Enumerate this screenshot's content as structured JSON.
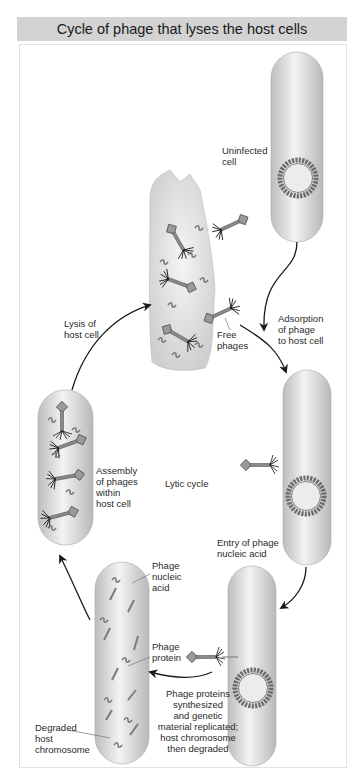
{
  "title": "Cycle of phage that lyses the host cells",
  "center_label": "Lytic cycle",
  "colors": {
    "title_bg": "#d3d3d3",
    "cell_fill": "#c8c8c8",
    "cell_highlight": "#f2f2f2",
    "chromosome_ring": "#6b6b6b",
    "arrow": "#1a1a1a",
    "text": "#2a2a2a"
  },
  "stages": [
    {
      "id": "uninfected",
      "label": "Uninfected\ncell"
    },
    {
      "id": "adsorption",
      "label": "Adsorption\nof phage\nto host cell"
    },
    {
      "id": "entry",
      "label": "Entry of phage\nnucleic acid"
    },
    {
      "id": "synthesis",
      "label": "Phage proteins\nsynthesized\nand genetic\nmaterial replicated;\nhost chromosome\nthen degraded"
    },
    {
      "id": "assembly",
      "label": "Assembly\nof phages\nwithin\nhost cell"
    },
    {
      "id": "lysis",
      "label": "Lysis of\nhost cell"
    }
  ],
  "callouts": {
    "free_phages": "Free\nphages",
    "phage_nucleic_acid": "Phage\nnucleic\nacid",
    "phage_protein": "Phage\nprotein",
    "degraded_chromosome": "Degraded\nhost\nchromosome"
  }
}
